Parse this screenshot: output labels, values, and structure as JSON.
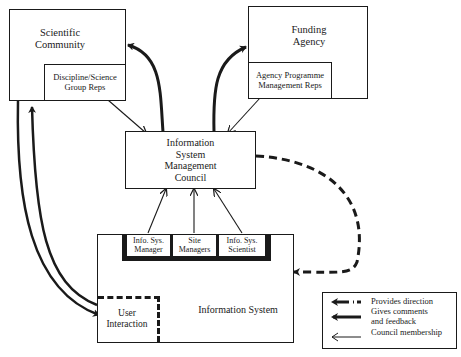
{
  "diagram": {
    "nodes": {
      "scientific_community": {
        "label": "Scientific\nCommunity",
        "line1": "Scientific",
        "line2": "Community"
      },
      "discipline_reps": {
        "line1": "Discipline/Science",
        "line2": "Group Reps"
      },
      "funding_agency": {
        "line1": "Funding",
        "line2": "Agency"
      },
      "agency_reps": {
        "line1": "Agency Programme",
        "line2": "Management Reps"
      },
      "council": {
        "line1": "Information",
        "line2": "System",
        "line3": "Management",
        "line4": "Council"
      },
      "info_sys_manager": {
        "line1": "Info. Sys.",
        "line2": "Manager"
      },
      "site_managers": {
        "line1": "Site",
        "line2": "Managers"
      },
      "info_sys_scientist": {
        "line1": "Info. Sys.",
        "line2": "Scientist"
      },
      "information_system": {
        "label": "Information System"
      },
      "user_interaction": {
        "line1": "User",
        "line2": "Interaction"
      }
    },
    "edges": [
      {
        "from": "Scientific Community",
        "to": "Discipline/Science Group Reps",
        "type": "comments"
      },
      {
        "from": "Funding Agency",
        "to": "Agency Programme Management Reps",
        "type": "comments"
      },
      {
        "from": "Discipline/Science Group Reps",
        "to": "Information System Management Council",
        "type": "membership"
      },
      {
        "from": "Agency Programme Management Reps",
        "to": "Information System Management Council",
        "type": "membership"
      },
      {
        "from": "Information System Management Council",
        "to": "Scientific Community",
        "type": "comments"
      },
      {
        "from": "Information System Management Council",
        "to": "Funding Agency",
        "type": "comments"
      },
      {
        "from": "Info. Sys. Manager",
        "to": "Information System Management Council",
        "type": "membership"
      },
      {
        "from": "Site Managers",
        "to": "Information System Management Council",
        "type": "membership"
      },
      {
        "from": "Info. Sys. Scientist",
        "to": "Information System Management Council",
        "type": "membership"
      },
      {
        "from": "Information System Management Council",
        "to": "Information System",
        "type": "direction"
      },
      {
        "from": "Scientific Community",
        "to": "User Interaction",
        "type": "comments"
      },
      {
        "from": "User Interaction",
        "to": "Scientific Community",
        "type": "comments"
      },
      {
        "from": "User Interaction",
        "to": "Site Managers",
        "type": "comments"
      }
    ]
  },
  "legend": {
    "direction": "Provides direction",
    "comments_line1": "Gives comments",
    "comments_line2": "and feedback",
    "membership": "Council membership"
  }
}
